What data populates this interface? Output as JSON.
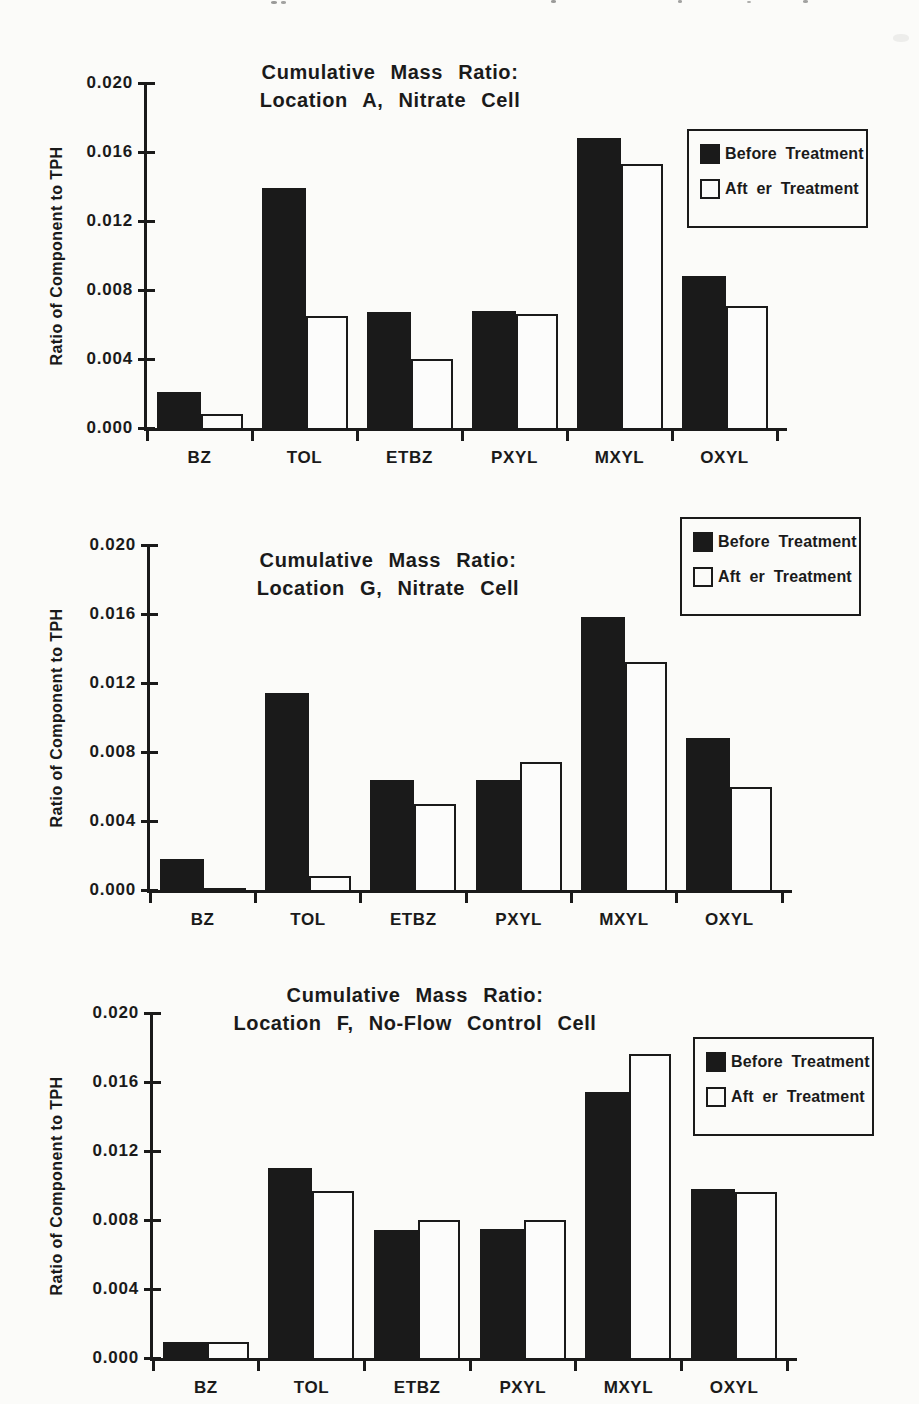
{
  "paper": {
    "background": "#fbfbf9",
    "ink": "#1a1a1a"
  },
  "legend": {
    "before_label": "Before Treatment",
    "after_label": "Aft er Treatment"
  },
  "y_ticks_labels": [
    "0.020",
    "0.016",
    "0.012",
    "0.008",
    "0.004",
    "0.000"
  ],
  "chart_data": [
    {
      "type": "bar",
      "title": "Cumulative Mass Ratio:",
      "subtitle": "Location A, Nitrate Cell",
      "ylabel": "Ratio of Component to TPH",
      "xlabel": "",
      "ylim": [
        0,
        0.02
      ],
      "yticks": [
        0.0,
        0.004,
        0.008,
        0.012,
        0.016,
        0.02
      ],
      "grid": false,
      "legend_position": "top-right",
      "legend_entries": [
        "Before Treatment",
        "After Treatment"
      ],
      "categories": [
        "BZ",
        "TOL",
        "ETBZ",
        "PXYL",
        "MXYL",
        "OXYL"
      ],
      "series": [
        {
          "name": "Before Treatment",
          "values": [
            0.0021,
            0.0139,
            0.0067,
            0.0068,
            0.0168,
            0.0088
          ]
        },
        {
          "name": "After Treatment",
          "values": [
            0.0008,
            0.0065,
            0.004,
            0.0066,
            0.0153,
            0.0071
          ]
        }
      ]
    },
    {
      "type": "bar",
      "title": "Cumulative Mass Ratio:",
      "subtitle": "Location G, Nitrate Cell",
      "ylabel": "Ratio of Component to TPH",
      "xlabel": "",
      "ylim": [
        0,
        0.02
      ],
      "yticks": [
        0.0,
        0.004,
        0.008,
        0.012,
        0.016,
        0.02
      ],
      "grid": false,
      "legend_position": "top-right",
      "legend_entries": [
        "Before Treatment",
        "After Treatment"
      ],
      "categories": [
        "BZ",
        "TOL",
        "ETBZ",
        "PXYL",
        "MXYL",
        "OXYL"
      ],
      "series": [
        {
          "name": "Before Treatment",
          "values": [
            0.0018,
            0.0114,
            0.0064,
            0.0064,
            0.0158,
            0.0088
          ]
        },
        {
          "name": "After Treatment",
          "values": [
            0.0001,
            0.0008,
            0.005,
            0.0074,
            0.0132,
            0.006
          ]
        }
      ]
    },
    {
      "type": "bar",
      "title": "Cumulative Mass Ratio:",
      "subtitle": "Location F, No-Flow Control Cell",
      "ylabel": "Ratio of Component to TPH",
      "xlabel": "",
      "ylim": [
        0,
        0.02
      ],
      "yticks": [
        0.0,
        0.004,
        0.008,
        0.012,
        0.016,
        0.02
      ],
      "grid": false,
      "legend_position": "top-right",
      "legend_entries": [
        "Before Treatment",
        "After Treatment"
      ],
      "categories": [
        "BZ",
        "TOL",
        "ETBZ",
        "PXYL",
        "MXYL",
        "OXYL"
      ],
      "series": [
        {
          "name": "Before Treatment",
          "values": [
            0.0009,
            0.011,
            0.0074,
            0.0075,
            0.0154,
            0.0098
          ]
        },
        {
          "name": "After Treatment",
          "values": [
            0.0009,
            0.0097,
            0.008,
            0.008,
            0.0176,
            0.0096
          ]
        }
      ]
    }
  ]
}
